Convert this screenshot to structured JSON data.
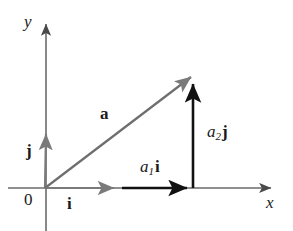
{
  "figure": {
    "background_color": "#ffffff",
    "width": 293,
    "height": 231,
    "colors": {
      "axis": "#6b6b6b",
      "unit_vector": "#7a7a7a",
      "resultant_vector": "#6e6e6e",
      "component_vector": "#111111",
      "text": "#1a1a1a"
    }
  },
  "axes": {
    "x_label": "x",
    "y_label": "y",
    "origin_label": "0"
  },
  "vectors": [
    {
      "id": "unit-i",
      "label": "i",
      "style": "bold-upright",
      "color": "#7a7a7a",
      "from": [
        45,
        188
      ],
      "to": [
        120,
        188
      ],
      "label_pos": [
        67,
        195
      ]
    },
    {
      "id": "unit-j",
      "label": "j",
      "style": "bold-upright",
      "color": "#7a7a7a",
      "from": [
        45,
        188
      ],
      "to": [
        46,
        128
      ],
      "label_pos": [
        26,
        142
      ]
    },
    {
      "id": "resultant-a",
      "label": "a",
      "style": "bold-upright",
      "color": "#6e6e6e",
      "from": [
        45,
        188
      ],
      "to": [
        196,
        72
      ],
      "label_pos": [
        100,
        105
      ]
    },
    {
      "id": "component-a1i",
      "label_parts": {
        "scalar": "a",
        "subscript": "1",
        "unit": "i"
      },
      "color": "#111111",
      "from": [
        122,
        188
      ],
      "to": [
        193,
        188
      ],
      "label_pos": [
        140,
        158
      ]
    },
    {
      "id": "component-a2j",
      "label_parts": {
        "scalar": "a",
        "subscript": "2",
        "unit": "j"
      },
      "color": "#111111",
      "from": [
        193,
        188
      ],
      "to": [
        193,
        78
      ],
      "label_pos": [
        207,
        123
      ]
    }
  ]
}
